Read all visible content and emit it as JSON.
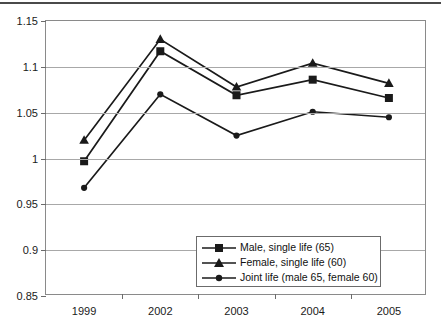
{
  "chart_data": {
    "type": "line",
    "title": "",
    "subtitle": "",
    "xlabel": "",
    "ylabel": "",
    "categories": [
      "1999",
      "2002",
      "2003",
      "2004",
      "2005"
    ],
    "ylim": [
      0.85,
      1.15
    ],
    "ytick_labels": [
      "1.15",
      "1.1",
      "1.05",
      "1",
      "0.95",
      "0.9",
      "0.85"
    ],
    "ytick_values": [
      1.15,
      1.1,
      1.05,
      1.0,
      0.95,
      0.9,
      0.85
    ],
    "grid": "horizontal",
    "legend_position": "bottom-right",
    "series": [
      {
        "name": "Male, single life (65)",
        "marker": "square",
        "color": "#1a1a1a",
        "values": [
          0.997,
          1.117,
          1.069,
          1.086,
          1.066
        ]
      },
      {
        "name": "Female, single life (60)",
        "marker": "triangle",
        "color": "#1a1a1a",
        "values": [
          1.02,
          1.13,
          1.078,
          1.104,
          1.082
        ]
      },
      {
        "name": "Joint life (male 65, female 60)",
        "marker": "circle",
        "color": "#1a1a1a",
        "values": [
          0.968,
          1.07,
          1.025,
          1.051,
          1.045
        ]
      }
    ]
  },
  "legend": {
    "items": [
      {
        "label": "Male, single life (65)",
        "marker": "square"
      },
      {
        "label": "Female, single life (60)",
        "marker": "triangle"
      },
      {
        "label": "Joint life (male 65, female 60)",
        "marker": "circle"
      }
    ]
  },
  "axes": {
    "y_ticks": [
      "1.15",
      "1.1",
      "1.05",
      "1",
      "0.95",
      "0.9",
      "0.85"
    ],
    "x_ticks": [
      "1999",
      "2002",
      "2003",
      "2004",
      "2005"
    ]
  }
}
